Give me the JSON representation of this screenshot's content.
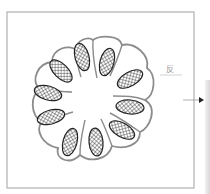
{
  "diagram": {
    "frame": {
      "x": 7,
      "y": 12,
      "width": 187,
      "height": 176,
      "stroke": "#9a9a9a"
    },
    "center": {
      "x": 93,
      "y": 100
    },
    "lobe_count": 9,
    "outline_color": "#8c8c8c",
    "ellipse_fill_pattern": "crosshatch",
    "ellipses": [
      {
        "cx": 82,
        "cy": 57,
        "rx": 7,
        "ry": 14,
        "angle": -15
      },
      {
        "cx": 107,
        "cy": 62,
        "rx": 7,
        "ry": 14,
        "angle": 15
      },
      {
        "cx": 130,
        "cy": 79,
        "rx": 7,
        "ry": 14,
        "angle": 60
      },
      {
        "cx": 130,
        "cy": 107,
        "rx": 7,
        "ry": 14,
        "angle": 95
      },
      {
        "cx": 122,
        "cy": 130,
        "rx": 7,
        "ry": 14,
        "angle": 120
      },
      {
        "cx": 96,
        "cy": 142,
        "rx": 7,
        "ry": 14,
        "angle": 175
      },
      {
        "cx": 70,
        "cy": 142,
        "rx": 7,
        "ry": 14,
        "angle": 195
      },
      {
        "cx": 51,
        "cy": 117,
        "rx": 7,
        "ry": 14,
        "angle": 255
      },
      {
        "cx": 48,
        "cy": 93,
        "rx": 7,
        "ry": 14,
        "angle": 285
      },
      {
        "cx": 61,
        "cy": 71,
        "rx": 7,
        "ry": 14,
        "angle": 315
      }
    ],
    "label": {
      "text": "反",
      "x": 167,
      "y": 65
    },
    "arrow": {
      "x1": 183,
      "y1": 100,
      "x2": 203,
      "y2": 100
    }
  }
}
